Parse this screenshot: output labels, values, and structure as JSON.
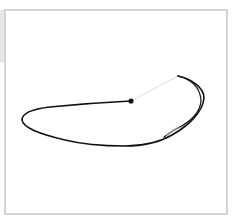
{
  "canvas": {
    "description": "Hand-drawn single-stroke doodle of an elongated loop shape",
    "stroke_color": "#111111",
    "guide_color": "#d8d8d8",
    "frame_color": "#d4d4d4",
    "background_color": "#ffffff"
  }
}
